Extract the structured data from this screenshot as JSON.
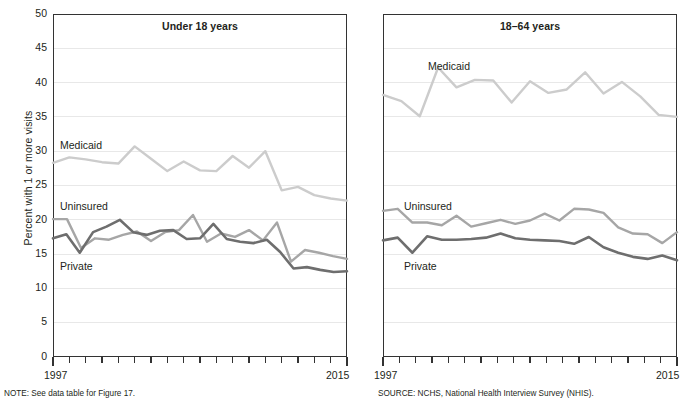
{
  "figure": {
    "cut_top_text": "",
    "y_axis_label": "Percent with 1 or more visits",
    "y_ticks": [
      "0",
      "5",
      "10",
      "15",
      "20",
      "25",
      "30",
      "35",
      "40",
      "45",
      "50"
    ],
    "x_start_label": "1997",
    "x_end_label": "2015",
    "note": "NOTE: See data table for Figure 17.",
    "source": "SOURCE: NCHS, National Health Interview Survey (NHIS)."
  },
  "colors": {
    "medicaid": "#cccccc",
    "uninsured": "#a6a6a6",
    "private": "#6e6e6e",
    "gridline": "#e8e8e8",
    "frame": "#333333",
    "text": "#231f20"
  },
  "panels": [
    {
      "id": "under-18",
      "title": "Under 18 years",
      "labels": {
        "medicaid": "Medicaid",
        "uninsured": "Uninsured",
        "private": "Private"
      }
    },
    {
      "id": "18-64",
      "title": "18–64 years",
      "labels": {
        "medicaid": "Medicaid",
        "uninsured": "Uninsured",
        "private": "Private"
      }
    }
  ],
  "chart_data": [
    {
      "type": "line",
      "title": "Under 18 years",
      "xlabel": "",
      "ylabel": "Percent with 1 or more visits",
      "ylim": [
        0,
        50
      ],
      "ytick_step": 5,
      "grid": true,
      "legend": "inline-labels",
      "x": [
        1997,
        1998,
        1999,
        2000,
        2001,
        2002,
        2003,
        2004,
        2005,
        2006,
        2007,
        2008,
        2009,
        2010,
        2011,
        2012,
        2013,
        2014,
        2015
      ],
      "series": [
        {
          "name": "Medicaid",
          "color": "#cccccc",
          "values": [
            28.3,
            29.1,
            28.8,
            28.4,
            28.2,
            30.7,
            28.9,
            27.1,
            28.5,
            27.2,
            27.1,
            29.3,
            27.6,
            30.0,
            24.3,
            24.8,
            23.6,
            23.1,
            22.8
          ]
        },
        {
          "name": "Uninsured",
          "color": "#a6a6a6",
          "values": [
            20.1,
            20.1,
            15.9,
            17.3,
            17.1,
            17.8,
            18.3,
            16.9,
            18.2,
            18.5,
            20.7,
            16.8,
            18.0,
            17.5,
            18.5,
            17.0,
            19.6,
            13.9,
            15.6,
            15.2,
            14.7,
            14.3
          ]
        },
        {
          "name": "Private",
          "color": "#6e6e6e",
          "values": [
            17.3,
            17.9,
            15.2,
            18.2,
            19.0,
            20.0,
            18.2,
            17.8,
            18.4,
            18.5,
            17.2,
            17.3,
            19.4,
            17.2,
            16.8,
            16.6,
            17.1,
            15.3,
            12.9,
            13.1,
            12.7,
            12.4,
            12.5
          ]
        }
      ]
    },
    {
      "type": "line",
      "title": "18–64 years",
      "xlabel": "",
      "ylabel": "Percent with 1 or more visits",
      "ylim": [
        0,
        50
      ],
      "ytick_step": 5,
      "grid": true,
      "legend": "inline-labels",
      "x": [
        1997,
        1998,
        1999,
        2000,
        2001,
        2002,
        2003,
        2004,
        2005,
        2006,
        2007,
        2008,
        2009,
        2010,
        2011,
        2012,
        2013,
        2014,
        2015
      ],
      "series": [
        {
          "name": "Medicaid",
          "color": "#cccccc",
          "values": [
            38.2,
            37.3,
            35.1,
            42.2,
            39.3,
            40.4,
            40.3,
            37.1,
            40.2,
            38.5,
            39.0,
            41.5,
            38.4,
            40.1,
            38.0,
            35.3,
            35.0
          ]
        },
        {
          "name": "Uninsured",
          "color": "#a6a6a6",
          "values": [
            21.3,
            21.6,
            19.6,
            19.6,
            19.2,
            20.6,
            19.0,
            19.5,
            20.0,
            19.4,
            19.9,
            20.9,
            19.9,
            21.6,
            21.5,
            21.0,
            18.9,
            18.0,
            17.9,
            16.6,
            18.2
          ]
        },
        {
          "name": "Private",
          "color": "#6e6e6e",
          "values": [
            17.0,
            17.4,
            15.2,
            17.6,
            17.1,
            17.1,
            17.2,
            17.4,
            18.0,
            17.3,
            17.1,
            17.0,
            16.9,
            16.5,
            17.5,
            16.0,
            15.2,
            14.6,
            14.3,
            14.8,
            14.1
          ]
        }
      ]
    }
  ]
}
